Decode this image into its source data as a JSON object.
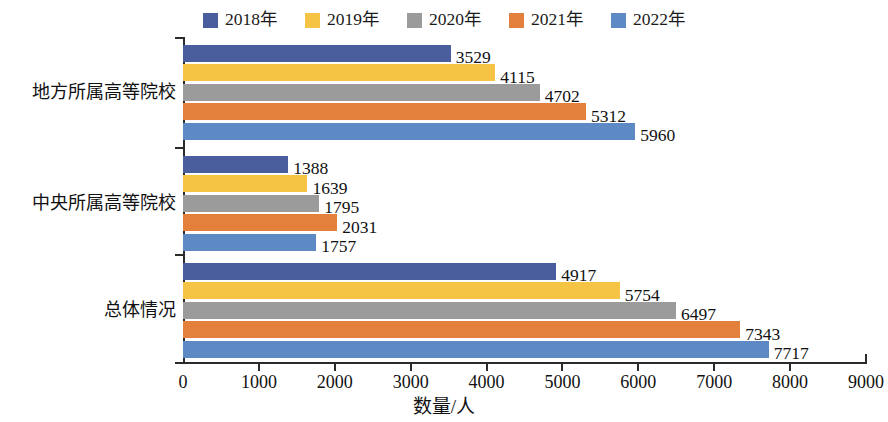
{
  "chart_data": {
    "type": "bar",
    "orientation": "horizontal",
    "title": "",
    "xlabel": "数量/人",
    "ylabel": "",
    "xlim": [
      0,
      9000
    ],
    "xticks": [
      0,
      1000,
      2000,
      3000,
      4000,
      5000,
      6000,
      7000,
      8000,
      9000
    ],
    "xtick_labels": [
      "0",
      "1000",
      "2000",
      "3000",
      "4000",
      "5000",
      "6000",
      "7000",
      "8000",
      "9000"
    ],
    "grid": false,
    "legend_position": "top-center",
    "categories": [
      "地方所属高等院校",
      "中央所属高等院校",
      "总体情况"
    ],
    "series": [
      {
        "name": "2018年",
        "color": "#4a5e9e",
        "values": [
          3529,
          1388,
          4917
        ]
      },
      {
        "name": "2019年",
        "color": "#f6c445",
        "values": [
          4115,
          1639,
          5754
        ]
      },
      {
        "name": "2020年",
        "color": "#9b9b9b",
        "values": [
          4702,
          1795,
          6497
        ]
      },
      {
        "name": "2021年",
        "color": "#e2803c",
        "values": [
          5312,
          2031,
          7343
        ]
      },
      {
        "name": "2022年",
        "color": "#5d8ac4",
        "values": [
          5960,
          1757,
          7717
        ]
      }
    ],
    "data_labels": [
      [
        "3529",
        "4115",
        "4702",
        "5312",
        "5960"
      ],
      [
        "1388",
        "1639",
        "1795",
        "2031",
        "1757"
      ],
      [
        "4917",
        "5754",
        "6497",
        "7343",
        "7717"
      ]
    ]
  },
  "axis": {
    "line_color": "#2b2b2b"
  }
}
